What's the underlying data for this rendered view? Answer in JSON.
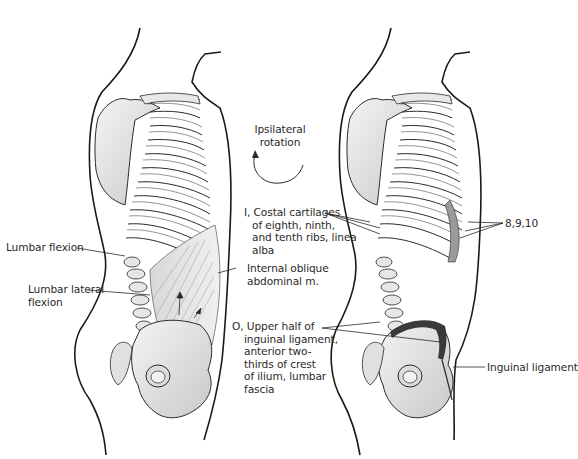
{
  "figure": {
    "top_fragment": "...",
    "left_panel": {
      "labels": {
        "lumbar_flexion": "Lumbar flexion",
        "lumbar_lateral_flexion_1": "Lumbar lateral",
        "lumbar_lateral_flexion_2": "flexion"
      }
    },
    "center": {
      "rotation_1": "Ipsilateral",
      "rotation_2": "rotation",
      "insertion_lines": [
        "I, Costal cartilages",
        "of eighth, ninth,",
        "and tenth ribs, linea",
        "alba"
      ],
      "muscle_lines": [
        "Internal oblique",
        "abdominal m."
      ],
      "origin_lines": [
        "O, Upper half of",
        "inguinal ligament,",
        "anterior two-",
        "thirds of crest",
        "of ilium, lumbar",
        "fascia"
      ]
    },
    "right_panel": {
      "labels": {
        "ribs": "8,9,10",
        "inguinal_ligament": "Inguinal ligament"
      }
    },
    "colors": {
      "outline": "#1a1a1a",
      "bone_fill": "#ededed",
      "bone_shadow": "#bdbdbd",
      "muscle": "#cfcfcf",
      "ligament_dark": "#3a3a3a",
      "text": "#2a2a2a"
    }
  }
}
